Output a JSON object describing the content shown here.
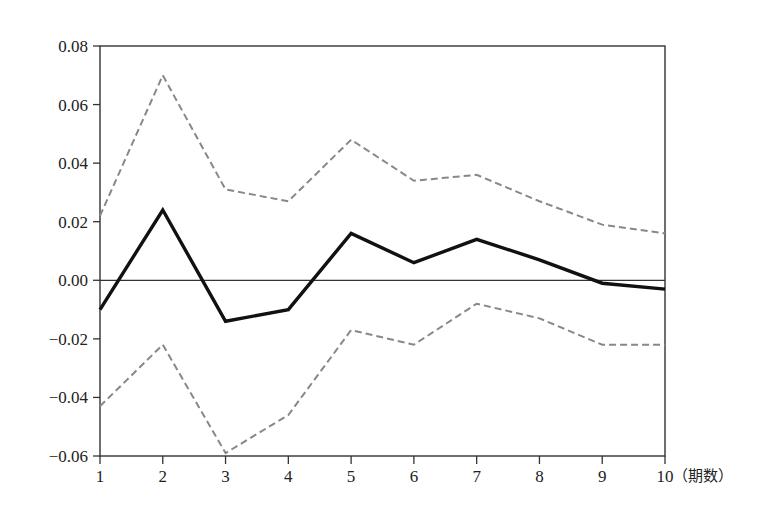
{
  "chart_data": {
    "type": "line",
    "title": "",
    "xlabel": "（期数）",
    "ylabel": "",
    "x": [
      1,
      2,
      3,
      4,
      5,
      6,
      7,
      8,
      9,
      10
    ],
    "xticks": [
      "1",
      "2",
      "3",
      "4",
      "5",
      "6",
      "7",
      "8",
      "9",
      "10"
    ],
    "yticks": [
      "0.08",
      "0.06",
      "0.04",
      "0.02",
      "0.00",
      "−0.02",
      "−0.04",
      "−0.06"
    ],
    "ylim": [
      -0.06,
      0.08
    ],
    "xlim": [
      1,
      10
    ],
    "grid": false,
    "zero_line": true,
    "legend": null,
    "series": [
      {
        "name": "response",
        "style": "solid",
        "color": "#111111",
        "values": [
          -0.01,
          0.024,
          -0.014,
          -0.01,
          0.016,
          0.006,
          0.014,
          0.007,
          -0.001,
          -0.003
        ]
      },
      {
        "name": "upper_band",
        "style": "dashed",
        "color": "#888888",
        "values": [
          0.022,
          0.07,
          0.031,
          0.027,
          0.048,
          0.034,
          0.036,
          0.027,
          0.019,
          0.016
        ]
      },
      {
        "name": "lower_band",
        "style": "dashed",
        "color": "#888888",
        "values": [
          -0.043,
          -0.022,
          -0.059,
          -0.046,
          -0.017,
          -0.022,
          -0.008,
          -0.013,
          -0.022,
          -0.022
        ]
      }
    ]
  },
  "layout": {
    "plot_left": 100,
    "plot_right": 665,
    "plot_top": 46,
    "plot_bottom": 456
  }
}
